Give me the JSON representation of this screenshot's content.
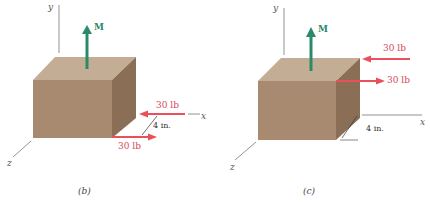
{
  "figures": [
    {
      "id": "b",
      "caption": "(b)",
      "axes": {
        "x": "x",
        "y": "y",
        "z": "z"
      },
      "moment_label": "M",
      "forces": [
        {
          "label": "30 lb",
          "direction": "left",
          "position": "upper"
        },
        {
          "label": "30 lb",
          "direction": "right",
          "position": "lower"
        }
      ],
      "dimension": "4 in."
    },
    {
      "id": "c",
      "caption": "(c)",
      "axes": {
        "x": "x",
        "y": "y",
        "z": "z"
      },
      "moment_label": "M",
      "forces": [
        {
          "label": "30 lb",
          "direction": "left",
          "position": "upper"
        },
        {
          "label": "30 lb",
          "direction": "right",
          "position": "lower"
        }
      ],
      "dimension": "4 in."
    }
  ],
  "colors": {
    "force": "#e8505b",
    "force_text": "#d9475a",
    "moment": "#2a8a6a",
    "box_front": "#a78a70",
    "box_top": "#c4ad95",
    "box_side": "#8a6e55",
    "axis": "#777777"
  }
}
